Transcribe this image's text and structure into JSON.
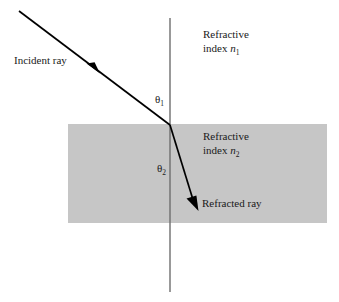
{
  "figure": {
    "background_color": "#ffffff",
    "ray_color": "#000000",
    "normal_color": "#6e6e6e",
    "medium_fill": "#c6c6c6"
  },
  "media": {
    "upper": {
      "line1": "Refractive",
      "line2_prefix": "index ",
      "symbol": "n",
      "subscript": "1"
    },
    "lower": {
      "line1": "Refractive",
      "line2_prefix": "index ",
      "symbol": "n",
      "subscript": "2"
    }
  },
  "rays": {
    "incident_label": "Incident ray",
    "refracted_label": "Refracted ray"
  },
  "angles": {
    "incidence": {
      "symbol": "θ",
      "subscript": "1"
    },
    "refraction": {
      "symbol": "θ",
      "subscript": "2"
    }
  },
  "geometry": {
    "normal_line": {
      "x": 170,
      "y1": 18,
      "y2": 292
    },
    "medium_band": {
      "x": 68,
      "y": 124,
      "width": 259,
      "height": 99
    },
    "incident_ray": {
      "x1": 19,
      "y1": 11,
      "x2": 170,
      "y2": 125
    },
    "incident_arrow": {
      "x": 96,
      "y": 70
    },
    "refracted_ray": {
      "x1": 170,
      "y1": 125,
      "x2": 198,
      "y2": 209
    }
  }
}
